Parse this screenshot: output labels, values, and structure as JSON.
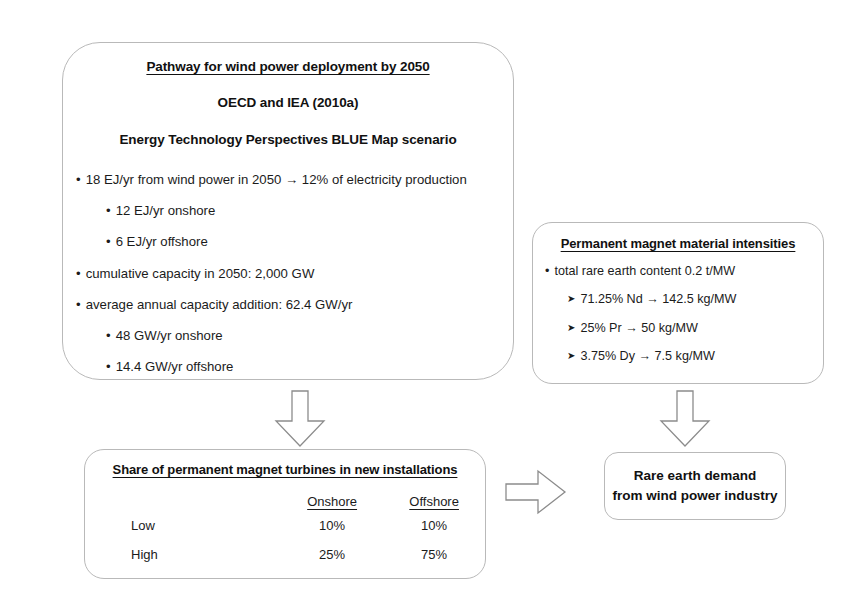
{
  "pathway_box": {
    "heading_1": "Pathway for wind power deployment by 2050",
    "heading_2": "OECD and IEA (2010a)",
    "heading_3": "Energy Technology Perspectives BLUE Map scenario",
    "bullets": [
      {
        "level": 1,
        "marker": "dot",
        "text": "18 EJ/yr from wind power in 2050 → 12% of electricity production"
      },
      {
        "level": 2,
        "marker": "dot",
        "text": "12 EJ/yr onshore"
      },
      {
        "level": 2,
        "marker": "dot",
        "text": "6 EJ/yr offshore"
      },
      {
        "level": 1,
        "marker": "dot",
        "text": "cumulative capacity in 2050: 2,000 GW"
      },
      {
        "level": 1,
        "marker": "dot",
        "text": "average annual capacity addition: 62.4 GW/yr"
      },
      {
        "level": 2,
        "marker": "dot",
        "text": "48 GW/yr onshore"
      },
      {
        "level": 2,
        "marker": "dot",
        "text": "14.4 GW/yr offshore"
      }
    ]
  },
  "magnet_box": {
    "heading": "Permanent magnet material intensities",
    "bullets": [
      {
        "level": 1,
        "marker": "dot",
        "text": "total rare earth content 0.2 t/MW"
      },
      {
        "level": 2,
        "marker": "arrowhead",
        "text": "71.25% Nd → 142.5 kg/MW"
      },
      {
        "level": 2,
        "marker": "arrowhead",
        "text": "25% Pr → 50 kg/MW"
      },
      {
        "level": 2,
        "marker": "arrowhead",
        "text": "3.75% Dy → 7.5 kg/MW"
      }
    ]
  },
  "share_box": {
    "heading": "Share of permanent magnet turbines in new installations",
    "columns": [
      "",
      "Onshore",
      "Offshore"
    ],
    "rows": [
      {
        "label": "Low",
        "onshore": "10%",
        "offshore": "10%"
      },
      {
        "label": "High",
        "onshore": "25%",
        "offshore": "75%"
      }
    ]
  },
  "result_box": {
    "line_1": "Rare earth demand",
    "line_2": "from wind power industry"
  },
  "arrows": [
    {
      "name": "arrow-down-to-share",
      "direction": "down"
    },
    {
      "name": "arrow-down-to-result",
      "direction": "down"
    },
    {
      "name": "arrow-right-to-result",
      "direction": "right"
    }
  ],
  "colors": {
    "box_border": "#b9b9b9",
    "arrow_outline": "#8c8c8c",
    "text": "#1b1b1b",
    "background": "#ffffff"
  }
}
